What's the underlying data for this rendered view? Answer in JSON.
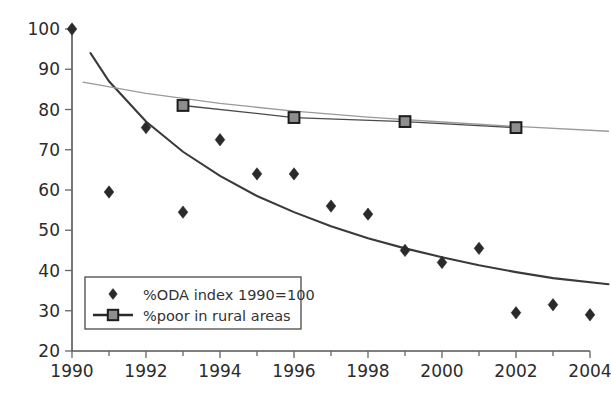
{
  "chart_data": {
    "type": "scatter",
    "title": "",
    "subtitle": "",
    "xlabel": "",
    "ylabel": "",
    "xlim": [
      1990,
      2004
    ],
    "ylim": [
      20,
      100
    ],
    "grid": false,
    "legend_position": "bottom-left",
    "x": [
      1990,
      1991,
      1992,
      1993,
      1994,
      1995,
      1996,
      1997,
      1998,
      1999,
      2000,
      2001,
      2002,
      2003,
      2004
    ],
    "xticklabels": [
      "1990",
      "1992",
      "1994",
      "1996",
      "1998",
      "2000",
      "2002",
      "2004"
    ],
    "xticks": [
      1990,
      1992,
      1994,
      1996,
      1998,
      2000,
      2002,
      2004
    ],
    "xminorticks": [
      1991,
      1993,
      1995,
      1997,
      1999,
      2001,
      2003
    ],
    "yticklabels": [
      "20",
      "30",
      "40",
      "50",
      "60",
      "70",
      "80",
      "90",
      "100"
    ],
    "yticks": [
      20,
      30,
      40,
      50,
      60,
      70,
      80,
      90,
      100
    ],
    "series": [
      {
        "name": "%ODA index 1990=100",
        "marker": "diamond",
        "marker_color": "#2a2a2a",
        "line": false,
        "x": [
          1990,
          1991,
          1992,
          1993,
          1994,
          1995,
          1996,
          1997,
          1998,
          1999,
          2000,
          2001,
          2002,
          2003,
          2004
        ],
        "values": [
          100,
          59.5,
          75.5,
          54.5,
          72.5,
          64,
          64,
          56,
          54,
          45,
          42,
          45.5,
          29.5,
          31.5,
          29
        ]
      },
      {
        "name": "%poor in rural areas",
        "marker": "square",
        "marker_color": "#8e8e8e",
        "line": true,
        "line_color": "#4a4a4a",
        "x": [
          1993,
          1996,
          1999,
          2002
        ],
        "values": [
          81,
          78,
          77,
          75.5
        ]
      }
    ],
    "trendlines": [
      {
        "name": "ODA trend",
        "color": "#3a3a3a",
        "x": [
          1990.5,
          1991,
          1992,
          1993,
          1994,
          1995,
          1996,
          1997,
          1998,
          1999,
          2000,
          2001,
          2002,
          2003,
          2004.5
        ],
        "values": [
          94.0,
          87.0,
          77.0,
          69.5,
          63.5,
          58.5,
          54.5,
          51.0,
          48.0,
          45.5,
          43.3,
          41.3,
          39.6,
          38.1,
          36.6
        ]
      },
      {
        "name": "rural poverty trend",
        "color": "#9a9a9a",
        "x": [
          1990.3,
          1992,
          1994,
          1996,
          1998,
          2000,
          2002,
          2004.5
        ],
        "values": [
          86.8,
          84.0,
          81.5,
          79.6,
          78.1,
          76.9,
          75.8,
          74.6
        ]
      }
    ],
    "legend": [
      {
        "label": "%ODA index 1990=100",
        "marker": "diamond"
      },
      {
        "label": "%poor in rural areas",
        "marker": "square-line"
      }
    ]
  }
}
